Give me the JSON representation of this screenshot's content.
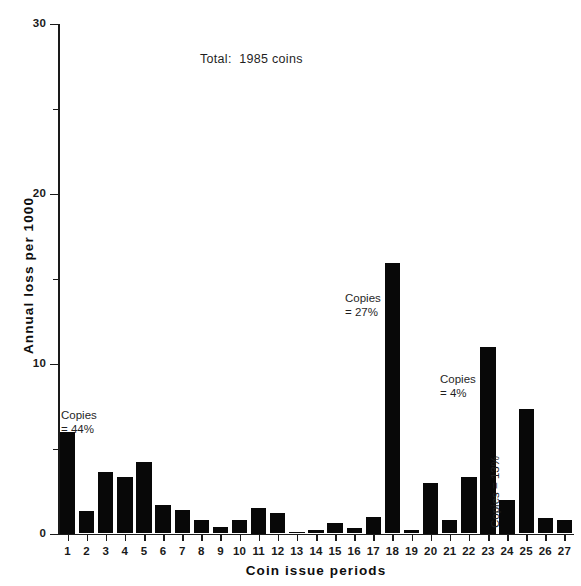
{
  "chart_data": {
    "type": "bar",
    "title": "Total:  1985 coins",
    "xlabel": "Coin issue periods",
    "ylabel": "Annual loss per 1000",
    "categories": [
      "1",
      "2",
      "3",
      "4",
      "5",
      "6",
      "7",
      "8",
      "9",
      "10",
      "11",
      "12",
      "13",
      "14",
      "15",
      "16",
      "17",
      "18",
      "19",
      "20",
      "21",
      "22",
      "23",
      "24",
      "25",
      "26",
      "27"
    ],
    "values": [
      6.0,
      1.3,
      3.6,
      3.3,
      4.2,
      1.7,
      1.4,
      0.8,
      0.4,
      0.8,
      1.5,
      1.2,
      0.1,
      0.2,
      0.6,
      0.3,
      1.0,
      15.9,
      0.2,
      3.0,
      0.8,
      3.3,
      11.0,
      2.0,
      7.3,
      0.9,
      0.8
    ],
    "ylim": [
      0,
      30
    ],
    "yticks_major": [
      0,
      10,
      20,
      30
    ],
    "yticks_minor": [
      5,
      15,
      25
    ],
    "grid": false,
    "legend": false,
    "bar_color": "#080808",
    "axis_color": "#1a1a1a"
  },
  "ytick_labels": [
    "0",
    "10",
    "20",
    "30"
  ],
  "annotations": [
    {
      "id": "ann-44",
      "lines": "Copies\n= 44%",
      "text": "Copies = 44%",
      "orientation": "horizontal"
    },
    {
      "id": "ann-27",
      "lines": "Copies\n= 27%",
      "text": "Copies = 27%",
      "orientation": "horizontal"
    },
    {
      "id": "ann-4",
      "lines": "Copies\n= 4%",
      "text": "Copies = 4%",
      "orientation": "horizontal"
    },
    {
      "id": "ann-13",
      "lines": "Copies = 13%",
      "text": "Copies = 13%",
      "orientation": "vertical"
    }
  ]
}
